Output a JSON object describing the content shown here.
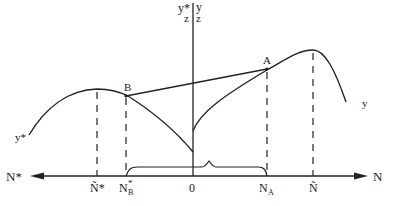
{
  "diagram": {
    "axis_labels": {
      "vertical_left_top": "y*",
      "vertical_left_bottom": "z",
      "vertical_right_top": "y",
      "vertical_right_bottom": "z",
      "horizontal_left": "N*",
      "horizontal_right": "N"
    },
    "tick_labels": {
      "n_tilde_star": "Ñ*",
      "n_b_star": "N",
      "n_b_star_super": "*",
      "n_b_star_sub": "B",
      "origin": "0",
      "n_a": "N",
      "n_a_sub": "A",
      "n_tilde": "Ñ"
    },
    "points": {
      "a": "A",
      "b": "B"
    },
    "curve_labels": {
      "y_star": "y*",
      "y": "y"
    },
    "colors": {
      "ink": "#222222",
      "background": "#ffffff"
    }
  }
}
